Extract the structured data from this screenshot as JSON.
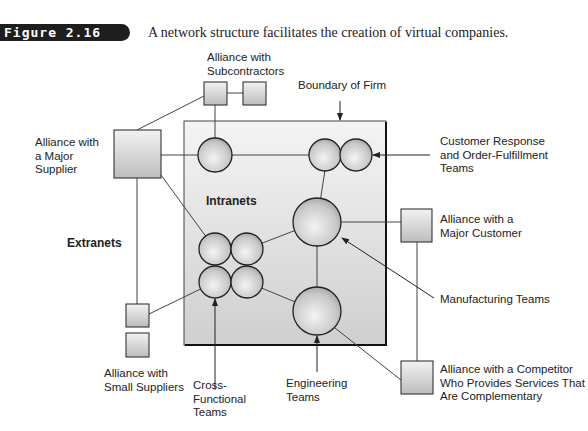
{
  "figure": {
    "label": "Figure 2.16",
    "caption": "A network structure facilitates the creation of virtual companies."
  },
  "labels": {
    "subcontractors": [
      "Alliance with",
      "Subcontractors"
    ],
    "boundary": "Boundary of Firm",
    "major_supplier": [
      "Alliance with",
      "a Major",
      "Supplier"
    ],
    "customer_response": [
      "Customer Response",
      "and Order-Fulfillment",
      "Teams"
    ],
    "intranets": "Intranets",
    "extranets": "Extranets",
    "major_customer": [
      "Alliance with a",
      "Major Customer"
    ],
    "manufacturing": "Manufacturing Teams",
    "small_suppliers": [
      "Alliance with",
      "Small Suppliers"
    ],
    "cross_functional": [
      "Cross-",
      "Functional",
      "Teams"
    ],
    "engineering": [
      "Engineering",
      "Teams"
    ],
    "competitor": [
      "Alliance with a Competitor",
      "Who Provides Services That",
      "Are Complementary"
    ]
  },
  "colors": {
    "figure_label_bg": "#1e1e1e",
    "boundary_fill": "#d9d9d9",
    "line": "#333333"
  }
}
